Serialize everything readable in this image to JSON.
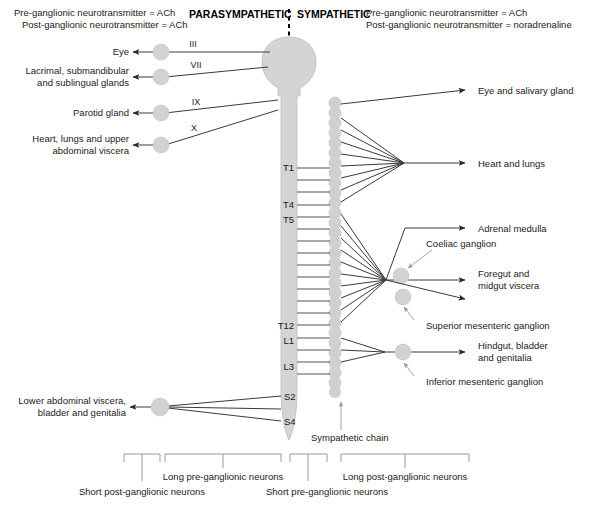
{
  "headers": {
    "parasympathetic": "PARASYMPATHETIC",
    "sympathetic": "SYMPATHETIC"
  },
  "notes": {
    "para_pre": "Pre-ganglionic neurotransmitter = ACh",
    "para_post": "Post-ganglionic neurotransmitter = ACh",
    "symp_pre": "Pre-ganglionic neurotransmitter = ACh",
    "symp_post": "Post-ganglionic neurotransmitter = noradrenaline"
  },
  "cranial_nerves": [
    {
      "numeral": "III",
      "target_line1": "Eye",
      "target_line2": ""
    },
    {
      "numeral": "VII",
      "target_line1": "Lacrimal, submandibular",
      "target_line2": "and sublingual glands"
    },
    {
      "numeral": "IX",
      "target_line1": "Parotid gland",
      "target_line2": ""
    },
    {
      "numeral": "X",
      "target_line1": "Heart, lungs and upper",
      "target_line2": "abdominal viscera"
    }
  ],
  "sacral": {
    "target_line1": "Lower abdominal viscera,",
    "target_line2": "bladder and genitalia",
    "segments": [
      "S2",
      "S4"
    ]
  },
  "spinal_segments": [
    "T1",
    "T4",
    "T5",
    "T12",
    "L1",
    "L3"
  ],
  "sympathetic_targets": [
    {
      "label_line1": "Eye and salivary gland",
      "label_line2": ""
    },
    {
      "label_line1": "Heart and lungs",
      "label_line2": ""
    },
    {
      "label_line1": "Adrenal medulla",
      "label_line2": ""
    },
    {
      "label_line1": "Foregut and",
      "label_line2": "midgut viscera"
    },
    {
      "label_line1": "Hindgut, bladder",
      "label_line2": "and genitalia"
    }
  ],
  "ganglion_labels": {
    "coeliac": "Coeliac ganglion",
    "superior_mesenteric": "Superior mesenteric ganglion",
    "inferior_mesenteric": "Inferior mesenteric ganglion",
    "chain": "Sympathetic chain"
  },
  "brackets": [
    {
      "label": "Short post-ganglionic neurons"
    },
    {
      "label": "Long pre-ganglionic neurons"
    },
    {
      "label": "Short pre-ganglionic neurons"
    },
    {
      "label": "Long post-ganglionic neurons"
    }
  ],
  "colors": {
    "cord_fill": "#d4d4d4",
    "ganglion_fill": "#d2d2d2",
    "line": "#3a3a3a",
    "pointer": "#9a9a9a",
    "text": "#1b1b1b",
    "background": "#ffffff"
  }
}
